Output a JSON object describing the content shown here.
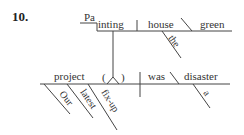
{
  "exercise_number": "10.",
  "diagram": {
    "type": "sentence-diagram",
    "subject_clause": {
      "gerund_raised": "Pa",
      "gerund_lowered": "inting",
      "object": "house",
      "object_modifier": "the",
      "object_complement": "green"
    },
    "main_clause": {
      "subject": "project",
      "subject_modifiers": [
        "Our",
        "latest",
        "fix-up"
      ],
      "appositive_open": "(",
      "appositive_close": ")",
      "verb": "was",
      "predicate_noun": "disaster",
      "predicate_modifier": "a"
    }
  }
}
